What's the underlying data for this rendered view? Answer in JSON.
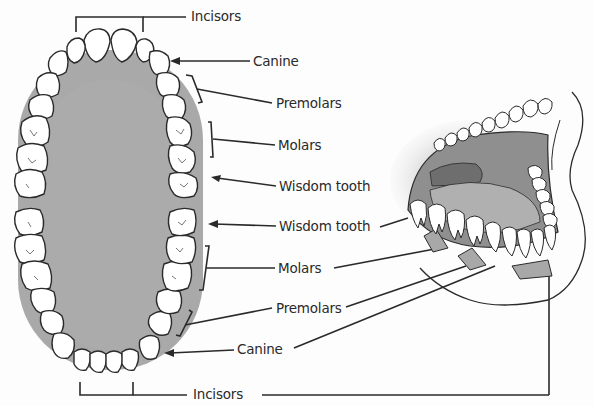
{
  "diagram": {
    "background": "#fdfdfd",
    "colors": {
      "palate": "#a9a9a9",
      "palate_shadow": "#969696",
      "tooth_fill": "#ffffff",
      "outline": "#2a2a2a",
      "mouth_interior": "#8f8f8f",
      "tongue": "#b0b0b0",
      "gum_tab": "#a8a8a8"
    },
    "labels": {
      "upper_incisors": "Incisors",
      "upper_canine": "Canine",
      "upper_premolars": "Premolars",
      "upper_molars": "Molars",
      "upper_wisdom": "Wisdom tooth",
      "lower_wisdom": "Wisdom tooth",
      "lower_molars": "Molars",
      "lower_premolars": "Premolars",
      "lower_canine": "Canine",
      "lower_incisors": "Incisors"
    },
    "sections": {
      "upper_arch": "Upper dental arch (maxillary)",
      "lower_arch": "Lower dental arch (mandibular)",
      "side_view": "Open mouth side view"
    }
  }
}
